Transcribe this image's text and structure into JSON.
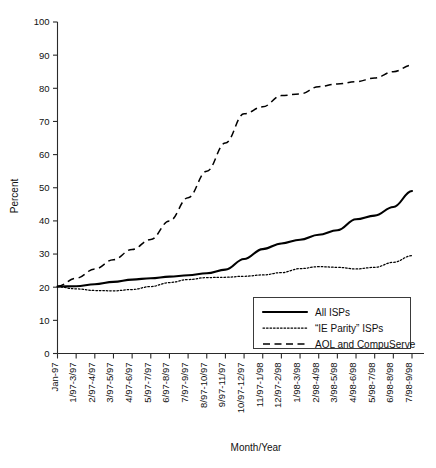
{
  "chart_data": {
    "type": "line",
    "title": "",
    "xlabel": "Month/Year",
    "ylabel": "Percent",
    "ylim": [
      0,
      100
    ],
    "yticks": [
      0,
      10,
      20,
      30,
      40,
      50,
      60,
      70,
      80,
      90,
      100
    ],
    "grid": false,
    "legend_position": "bottom-right",
    "categories": [
      "Jan-97",
      "1/97-3/97",
      "2/97-4/97",
      "3/97-5/97",
      "4/97-6/97",
      "5/97-7/97",
      "6/97-8/97",
      "7/97-9/97",
      "8/97-10/97",
      "9/97-11/97",
      "10/97-12/97",
      "11/97-1/98",
      "12/97-2/98",
      "1/98-3/98",
      "2/98-4/98",
      "3/98-5/98",
      "4/98-6/98",
      "5/98-7/98",
      "6/98-8/98",
      "7/98-9/98"
    ],
    "series": [
      {
        "name": "All ISPs",
        "style": "solid",
        "values": [
          20.2,
          20.3,
          20.9,
          21.6,
          22.3,
          22.7,
          23.2,
          23.6,
          24.2,
          25.3,
          28.5,
          31.5,
          33.2,
          34.3,
          35.8,
          37.2,
          40.5,
          41.6,
          44.2,
          49.0
        ]
      },
      {
        "name": "“IE Parity” ISPs",
        "style": "dotted",
        "values": [
          20.1,
          19.5,
          19.0,
          18.9,
          19.3,
          20.2,
          21.4,
          22.3,
          22.9,
          23.0,
          23.3,
          23.7,
          24.4,
          25.6,
          26.2,
          26.0,
          25.5,
          26.0,
          27.5,
          29.5
        ]
      },
      {
        "name": "AOL and CompuServe",
        "style": "dashed",
        "values": [
          20.3,
          22.7,
          25.5,
          28.3,
          31.4,
          34.4,
          40.0,
          47.0,
          55.0,
          63.5,
          72.3,
          74.4,
          77.8,
          78.3,
          80.5,
          81.3,
          82.0,
          83.1,
          85.0,
          87.0
        ]
      }
    ]
  },
  "legend": {
    "items": [
      {
        "label": "All ISPs",
        "style": "solid"
      },
      {
        "label": "“IE Parity” ISPs",
        "style": "dotted"
      },
      {
        "label": "AOL and CompuServe",
        "style": "dashed"
      }
    ]
  }
}
